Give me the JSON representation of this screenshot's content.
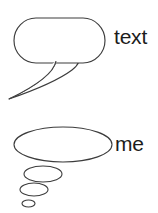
{
  "canvas": {
    "width": 158,
    "height": 213,
    "background_color": "#ffffff",
    "stroke_color": "#3c3c3c",
    "text_color": "#1c1c1c"
  },
  "diagram": {
    "title": "",
    "items": [
      {
        "id": "speech-bubble",
        "shape_name": "speech-balloon",
        "label": "text",
        "description": "rounded speech bubble with long curved tail pointing down-left",
        "body": {
          "x": 14,
          "y": 18,
          "width": 91,
          "height": 45,
          "corner_radius": 22
        },
        "tail_tip": {
          "x": 9,
          "y": 99
        }
      },
      {
        "id": "thought-bubble",
        "shape_name": "thought-balloon",
        "label": "me",
        "description": "large ellipse with three decreasing trailing ellipses toward lower-left",
        "body": {
          "cx": 63,
          "cy": 144.5,
          "rx": 49,
          "ry": 17.5
        },
        "trail": [
          {
            "cx": 43,
            "cy": 174,
            "rx": 19,
            "ry": 8
          },
          {
            "cx": 34,
            "cy": 189.5,
            "rx": 14,
            "ry": 6.5
          },
          {
            "cx": 28.5,
            "cy": 203.5,
            "rx": 6.5,
            "ry": 3.5
          }
        ]
      }
    ]
  },
  "labels": {
    "speech": "text",
    "thought": "me"
  }
}
